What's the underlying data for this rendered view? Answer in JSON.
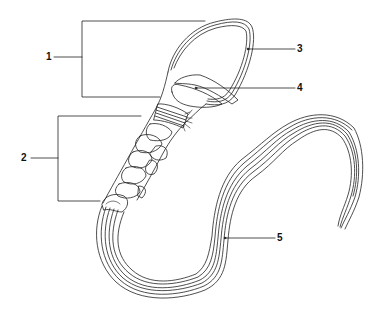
{
  "diagram": {
    "labels": [
      {
        "id": "1",
        "text": "1",
        "target": "head bracket",
        "x": 46,
        "y": 52
      },
      {
        "id": "2",
        "text": "2",
        "target": "midpiece bracket",
        "x": 21,
        "y": 153
      },
      {
        "id": "3",
        "text": "3",
        "target": "head outer membrane",
        "x": 297,
        "y": 44
      },
      {
        "id": "4",
        "text": "4",
        "target": "nucleus",
        "x": 297,
        "y": 83
      },
      {
        "id": "5",
        "text": "5",
        "target": "tail / flagellum",
        "x": 277,
        "y": 233
      }
    ],
    "line_color": "#222222",
    "background": "#ffffff"
  }
}
